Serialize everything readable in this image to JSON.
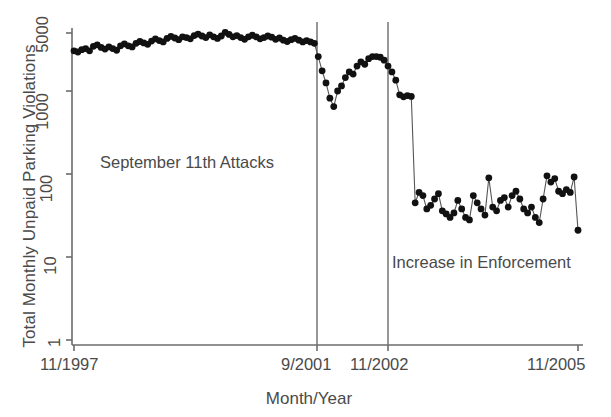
{
  "chart_data": {
    "type": "line",
    "title": "",
    "xlabel": "Month/Year",
    "ylabel": "Total Monthly Unpaid Parking Violations",
    "yscale": "log",
    "ylim": [
      1,
      9000
    ],
    "yticks": [
      1,
      10,
      100,
      1000,
      5000
    ],
    "ytick_labels": [
      "1",
      "10",
      "100",
      "1000",
      "5000"
    ],
    "xtick_labels": [
      "11/1997",
      "9/2001",
      "11/2002",
      "11/2005"
    ],
    "xtick_positions": [
      0,
      46,
      60,
      96
    ],
    "x_start": "11/1997",
    "x_end": "11/2005",
    "n_points": 97,
    "grid": false,
    "legend": false,
    "marker": "filled-circle",
    "marker_color": "#111111",
    "line_color": "#555555",
    "annotations": [
      {
        "text": "September 11th Attacks",
        "x_index": 20,
        "y_value": 300
      },
      {
        "text": "Increase in Enforcement",
        "x_index": 74,
        "y_value": 13
      }
    ],
    "vlines": [
      {
        "label": "9/2001",
        "x_index": 46
      },
      {
        "label": "11/2002",
        "x_index": 60
      }
    ],
    "series": [
      {
        "name": "Total Monthly Unpaid Parking Violations",
        "values": [
          3050,
          2950,
          3150,
          3250,
          3050,
          3450,
          3600,
          3350,
          3200,
          3400,
          3250,
          3100,
          3500,
          3700,
          3500,
          3400,
          3750,
          3950,
          3800,
          3650,
          4000,
          4250,
          4050,
          3900,
          4300,
          4550,
          4350,
          4150,
          4500,
          4400,
          4250,
          4650,
          4850,
          4600,
          4400,
          4750,
          4500,
          4300,
          4600,
          5100,
          4800,
          4500,
          4650,
          4400,
          4200,
          4500,
          4700,
          4500,
          4250,
          4400,
          4600,
          4450,
          4200,
          4350,
          4100,
          3950,
          4150,
          4300,
          4100,
          3900,
          4050,
          3900,
          3750,
          2600,
          1750,
          1250,
          820,
          650,
          1000,
          1150,
          1450,
          1700,
          1600,
          2000,
          2250,
          2100,
          2450,
          2600,
          2600,
          2550,
          2350,
          2000,
          1700,
          1350,
          900,
          850,
          880,
          860,
          45,
          60,
          55,
          38,
          42,
          50,
          58,
          36,
          33,
          30,
          34,
          48,
          38,
          30,
          28,
          55,
          45,
          38,
          32,
          90,
          40,
          36,
          48,
          52,
          40,
          55,
          62,
          50,
          38,
          34,
          40,
          30,
          26,
          50,
          95,
          80,
          88,
          62,
          58,
          65,
          60,
          92,
          21
        ]
      }
    ]
  },
  "axes": {
    "ytick_labels": [
      "5000",
      "1000",
      "100",
      "10",
      "1"
    ],
    "xtick_labels": [
      "11/1997",
      "9/2001",
      "11/2002",
      "11/2005"
    ]
  },
  "annotations": {
    "sept11": "September 11th Attacks",
    "enforcement": "Increase in Enforcement"
  },
  "labels": {
    "y_axis": "Total Monthly Unpaid Parking Violations",
    "x_axis": "Month/Year"
  }
}
